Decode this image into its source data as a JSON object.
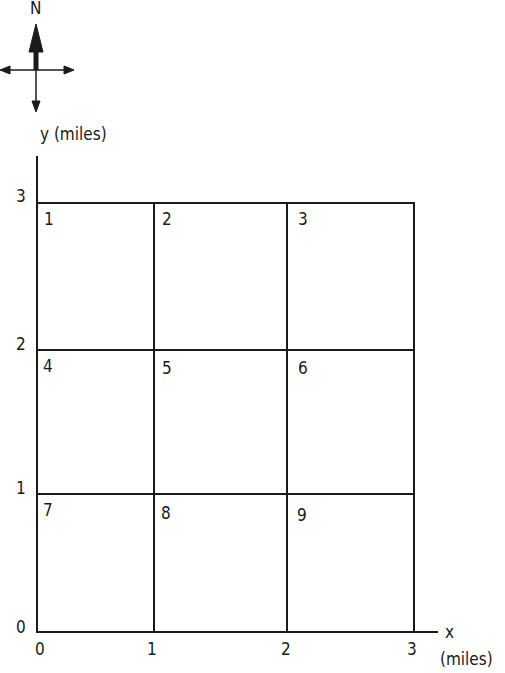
{
  "compass": {
    "north_label": "N"
  },
  "axes": {
    "y_label": "y  (miles)",
    "x_label": "x",
    "x_unit": "(miles)",
    "y_ticks": [
      "0",
      "1",
      "2",
      "3"
    ],
    "x_ticks": [
      "0",
      "1",
      "2",
      "3"
    ]
  },
  "cells": [
    {
      "id": "1",
      "row": 0,
      "col": 0
    },
    {
      "id": "2",
      "row": 0,
      "col": 1
    },
    {
      "id": "3",
      "row": 0,
      "col": 2
    },
    {
      "id": "4",
      "row": 1,
      "col": 0
    },
    {
      "id": "5",
      "row": 1,
      "col": 1
    },
    {
      "id": "6",
      "row": 1,
      "col": 2
    },
    {
      "id": "7",
      "row": 2,
      "col": 0
    },
    {
      "id": "8",
      "row": 2,
      "col": 1
    },
    {
      "id": "9",
      "row": 2,
      "col": 2
    }
  ],
  "colors": {
    "line": "#1a1a1a",
    "background": "#ffffff"
  }
}
